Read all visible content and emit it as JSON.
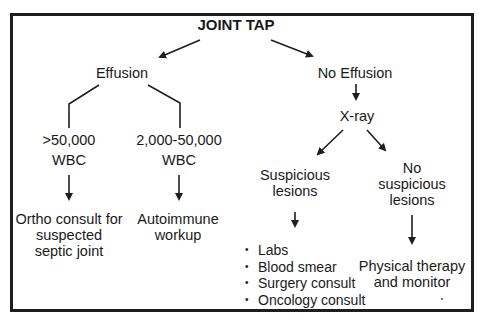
{
  "diagram": {
    "title": "JOINT TAP",
    "nodes": {
      "effusion": "Effusion",
      "no_effusion": "No Effusion",
      "wbc_high_line1": ">50,000",
      "wbc_high_line2": "WBC",
      "wbc_mid_line1": "2,000-50,000",
      "wbc_mid_line2": "WBC",
      "ortho_line1": "Ortho consult for",
      "ortho_line2": "suspected",
      "ortho_line3": "septic joint",
      "autoimmune_line1": "Autoimmune",
      "autoimmune_line2": "workup",
      "xray": "X-ray",
      "suspicious_line1": "Suspicious",
      "suspicious_line2": "lesions",
      "no_suspicious_line1": "No",
      "no_suspicious_line2": "suspicious",
      "no_suspicious_line3": "lesions",
      "pt_line1": "Physical therapy",
      "pt_line2": "and monitor"
    },
    "suspicious_actions": [
      "Labs",
      "Blood smear",
      "Surgery consult",
      "Oncology consult"
    ],
    "colors": {
      "stroke": "#1e1e1e",
      "text": "#1a1a1a",
      "background": "#ffffff"
    }
  }
}
